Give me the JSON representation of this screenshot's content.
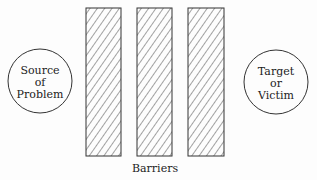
{
  "diagram": {
    "source_node": {
      "lines": [
        "Source",
        "of",
        "Problem"
      ]
    },
    "target_node": {
      "lines": [
        "Target",
        "or",
        "Victim"
      ]
    },
    "barriers": {
      "count": 3,
      "label": "Barriers"
    }
  }
}
